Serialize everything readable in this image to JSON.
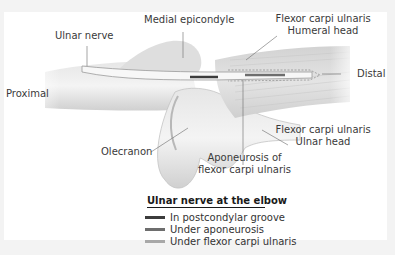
{
  "figure": {
    "labels": {
      "medial_epicondyle": "Medial epicondyle",
      "ulnar_nerve": "Ulnar nerve",
      "proximal": "Proximal",
      "fcu_humeral_1": "Flexor carpi ulnaris",
      "fcu_humeral_2": "Humeral head",
      "distal": "Distal",
      "fcu_ulnar_1": "Flexor carpi ulnaris",
      "fcu_ulnar_2": "Ulnar head",
      "olecranon": "Olecranon",
      "aponeurosis_1": "Aponeurosis of",
      "aponeurosis_2": "flexor carpi ulnaris"
    },
    "legend": {
      "title": "Ulnar nerve at the elbow",
      "items": [
        {
          "label": "In postcondylar groove",
          "color": "#3c3c3c"
        },
        {
          "label": "Under aponeurosis",
          "color": "#6e6e6e"
        },
        {
          "label": "Under flexor carpi ulnaris",
          "color": "#a8a8a8"
        }
      ]
    }
  }
}
